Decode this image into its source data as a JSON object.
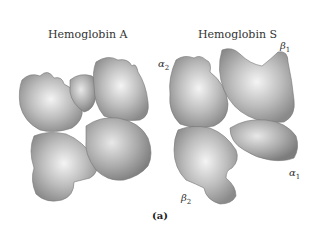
{
  "figure": {
    "panels": [
      {
        "title": "Hemoglobin A"
      },
      {
        "title": "Hemoglobin S"
      }
    ],
    "subunit_labels": [
      {
        "symbol": "α",
        "sub": "2"
      },
      {
        "symbol": "β",
        "sub": "1"
      },
      {
        "symbol": "α",
        "sub": "1"
      },
      {
        "symbol": "β",
        "sub": "2"
      }
    ],
    "caption": "(a)"
  }
}
